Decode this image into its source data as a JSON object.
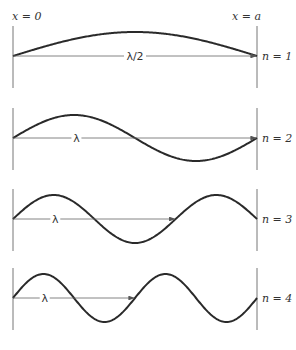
{
  "top_caption_partial": "",
  "labels": {
    "left_boundary": "x = 0",
    "right_boundary": "x = a"
  },
  "panels": [
    {
      "n_label": "n = 1",
      "n": 1,
      "wavelength_label": "λ/2",
      "baseline_y": 56
    },
    {
      "n_label": "n = 2",
      "n": 2,
      "wavelength_label": "λ",
      "baseline_y": 138
    },
    {
      "n_label": "n = 3",
      "n": 3,
      "wavelength_label": "λ",
      "baseline_y": 219
    },
    {
      "n_label": "n = 4",
      "n": 4,
      "wavelength_label": "λ",
      "baseline_y": 298
    }
  ],
  "colors": {
    "curve": "#2a2a2a",
    "axis": "#777777",
    "text": "#333333"
  }
}
